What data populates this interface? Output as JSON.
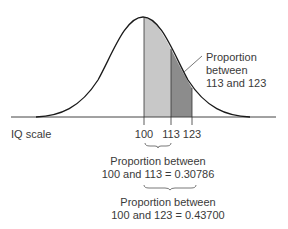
{
  "diagram": {
    "axis_label": "IQ scale",
    "ticks": [
      {
        "label": "100",
        "x": 144
      },
      {
        "label": "113",
        "x": 171
      },
      {
        "label": "123",
        "x": 192
      }
    ],
    "callout": {
      "line1": "Proportion",
      "line2": "between",
      "line3": "113 and 123"
    },
    "bracket1": {
      "line1": "Proportion between",
      "line2": "100 and 113 = 0.30786"
    },
    "bracket2": {
      "line1": "Proportion between",
      "line2": "100 and 123 = 0.43700"
    },
    "colors": {
      "light_region": "#c8c8c8",
      "dark_region": "#8c8c8c",
      "curve": "#1a1a1a",
      "axis": "#444444"
    }
  }
}
